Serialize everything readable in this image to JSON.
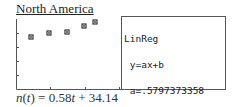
{
  "title": "North America",
  "calculator": {
    "lines": [
      "LinReg",
      " y=ax+b",
      " a=.5797373358",
      " b=34.1358349"
    ]
  },
  "equation": {
    "lhs_func": "n",
    "lhs_var": "t",
    "rhs_coef": "0.58",
    "rhs_var": "t",
    "rhs_const": "34.14",
    "text": "n(t) = 0.58t + 34.14"
  },
  "chart_data": {
    "type": "scatter",
    "title": "North America",
    "xlabel": "",
    "ylabel": "",
    "points_px": [
      [
        31,
        37
      ],
      [
        49,
        33
      ],
      [
        67,
        32
      ],
      [
        84,
        26
      ],
      [
        95,
        22
      ]
    ],
    "series": [
      {
        "name": "data",
        "x": [
          1,
          2,
          3,
          4,
          5
        ],
        "y": [
          35.0,
          36.2,
          36.5,
          38.5,
          39.5
        ]
      }
    ],
    "regression": {
      "type": "linear",
      "form": "y=ax+b",
      "a": 0.5797373358,
      "b": 34.1358349
    },
    "grid": false,
    "legend": "none"
  },
  "colors": {
    "axis": "#555555",
    "point": "#333333",
    "text": "#222222"
  }
}
